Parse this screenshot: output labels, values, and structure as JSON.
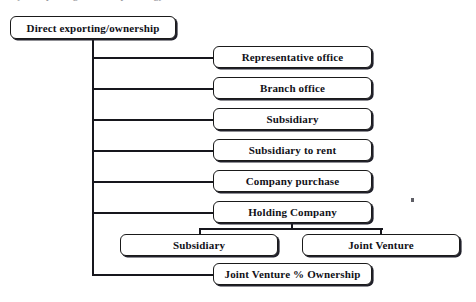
{
  "diagram": {
    "title_bleed": "ty of exporting/ownership strategy",
    "root": {
      "label": "Direct exporting/ownership"
    },
    "branches": [
      {
        "label": "Representative office"
      },
      {
        "label": "Branch office"
      },
      {
        "label": "Subsidiary"
      },
      {
        "label": "Subsidiary to rent"
      },
      {
        "label": "Company purchase"
      },
      {
        "label": "Holding Company"
      }
    ],
    "holding_children": [
      {
        "label": "Subsidiary"
      },
      {
        "label": "Joint Venture"
      }
    ],
    "bottom": {
      "label": "Joint Venture % Ownership"
    },
    "colors": {
      "background": "#ffffff",
      "line": "#17171d",
      "box_border": "#1a1a1a",
      "box_fill": "#ffffff",
      "text": "#111118"
    }
  }
}
